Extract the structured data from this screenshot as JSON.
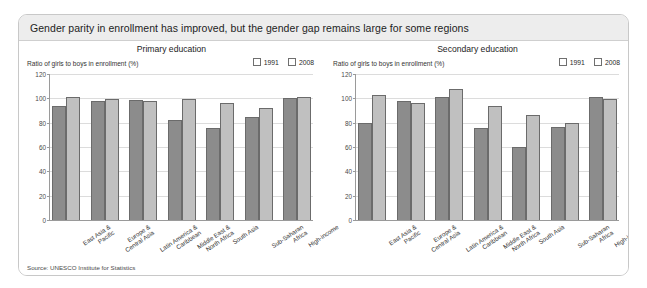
{
  "figure": {
    "title": "Gender parity in enrollment has improved, but the gender gap remains large for some regions",
    "source": "Source: UNESCO Institute for Statistics",
    "colors": {
      "series_1991": "#8c8c8c",
      "series_2008": "#c0c0c0",
      "header_band": "#ededed",
      "border": "#c8c8c8",
      "gridline": "#dcdcdc",
      "axis": "#9a9a9a"
    }
  },
  "chart_data": [
    {
      "type": "bar",
      "title": "Primary education",
      "ylabel": "Ratio of girls to boys in enrollment (%)",
      "xlabel": "",
      "ylim": [
        0,
        120
      ],
      "yticks": [
        0,
        20,
        40,
        60,
        80,
        100,
        120
      ],
      "grid": true,
      "legend_position": "top-right",
      "categories": [
        "East Asia &\nPacific",
        "Europe &\nCentral Asia",
        "Latin America &\nCaribbean",
        "Middle East &\nNorth Africa",
        "South Asia",
        "Sub-Saharan\nAfrica",
        "High-income"
      ],
      "series": [
        {
          "name": "1991",
          "values": [
            94,
            98,
            99,
            82.5,
            76,
            84.5,
            100
          ]
        },
        {
          "name": "2008",
          "values": [
            101,
            99.5,
            97.5,
            99.5,
            96,
            92,
            101
          ]
        }
      ]
    },
    {
      "type": "bar",
      "title": "Secondary education",
      "ylabel": "Ratio of girls to boys in enrollment (%)",
      "xlabel": "",
      "ylim": [
        0,
        120
      ],
      "yticks": [
        0,
        20,
        40,
        60,
        80,
        100,
        120
      ],
      "grid": true,
      "legend_position": "top-right",
      "categories": [
        "East Asia &\nPacific",
        "Europe &\nCentral Asia",
        "Latin America &\nCaribbean",
        "Middle East &\nNorth Africa",
        "South Asia",
        "Sub-Saharan\nAfrica",
        "High-income"
      ],
      "series": [
        {
          "name": "1991",
          "values": [
            80,
            98,
            101,
            75.5,
            60,
            76.5,
            101.5
          ]
        },
        {
          "name": "2008",
          "values": [
            103,
            96.5,
            108,
            94,
            86.5,
            80,
            99.5
          ]
        }
      ]
    }
  ]
}
